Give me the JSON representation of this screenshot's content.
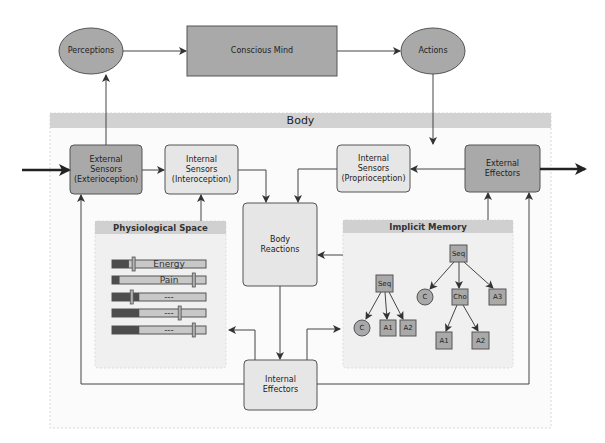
{
  "top": {
    "perceptions": "Perceptions",
    "conscious_mind": "Conscious Mind",
    "actions": "Actions"
  },
  "body": {
    "title": "Body",
    "external_sensors": "External\nSensors\n(Exterioception)",
    "internal_sensors_intero": "Internal\nSensors\n(Interoception)",
    "internal_sensors_proprio": "Internal\nSensors\n(Proprioception)",
    "external_effectors": "External\nEffectors",
    "body_reactions": "Body\nReactions",
    "internal_effectors": "Internal\nEffectors"
  },
  "physiological_space": {
    "title": "Physiological Space",
    "bars": [
      {
        "label": "Energy",
        "fill_pct": 18,
        "marker_pct": 23
      },
      {
        "label": "Pain",
        "fill_pct": 8,
        "marker_pct": 87
      },
      {
        "label": "---",
        "fill_pct": 29,
        "marker_pct": 21
      },
      {
        "label": "---",
        "fill_pct": 29,
        "marker_pct": 72
      },
      {
        "label": "---",
        "fill_pct": 29,
        "marker_pct": 87
      }
    ]
  },
  "implicit_memory": {
    "title": "Implicit Memory",
    "tree1": {
      "root": "Seq",
      "children": [
        "C",
        "A1",
        "A2"
      ]
    },
    "tree2": {
      "root": "Seq",
      "children": [
        "C",
        "Cho",
        "A3"
      ],
      "cho_children": [
        "A1",
        "A2"
      ]
    }
  },
  "colors": {
    "dark_box": "#a9a9a9",
    "light_box": "#e6e6e6",
    "panel_header": "#d0d0d0",
    "line": "#444444",
    "bar_dark": "#4d4d4d",
    "bar_light": "#c8c8c8"
  }
}
